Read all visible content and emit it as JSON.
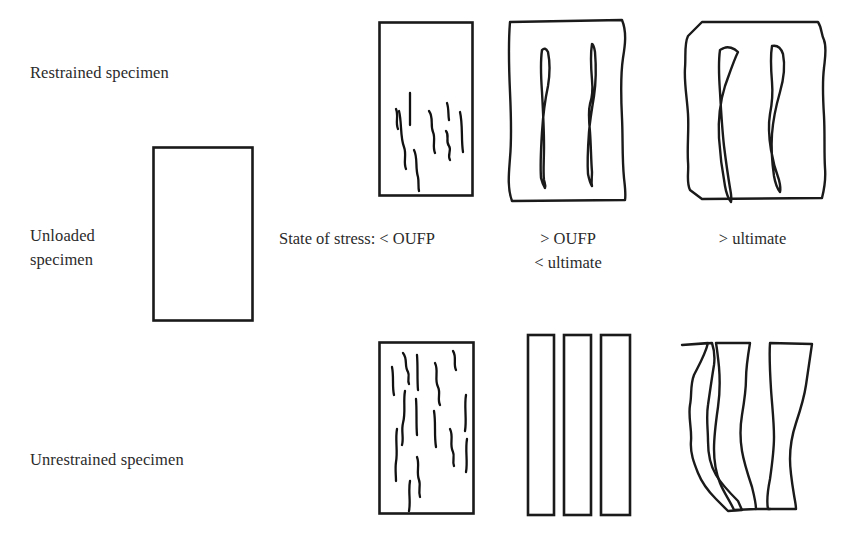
{
  "figure": {
    "background_color": "#ffffff",
    "ink_color": "#1a1a1a",
    "text_color": "#2b2b2b"
  },
  "row_labels": {
    "restrained": "Restrained specimen",
    "unloaded": "Unloaded\nspecimen",
    "unrestrained": "Unrestrained specimen"
  },
  "captions": {
    "prefix": "State of stress:",
    "column1": "State of stress: < OUFP",
    "column2": "> OUFP\n< ultimate",
    "column3": "> ultimate"
  },
  "panels": {
    "unloaded_specimen": {
      "name": "unloaded-specimen",
      "description": "Plain undamaged rectangular prism"
    },
    "restrained_low": {
      "name": "restrained-below-oufp",
      "description": "Rectangular specimen with short scattered microcracks in the central region"
    },
    "restrained_mid": {
      "name": "restrained-above-oufp",
      "description": "Bulged specimen with two elongated lens shaped vertical cracks"
    },
    "restrained_ultimate": {
      "name": "restrained-above-ultimate",
      "description": "Heavily bulged specimen with two wide open vertical cracks"
    },
    "unrestrained_low": {
      "name": "unrestrained-below-oufp",
      "description": "Rectangular specimen with many distributed vertical microcracks"
    },
    "unrestrained_mid": {
      "name": "unrestrained-above-oufp",
      "description": "Specimen split into three separate vertical slabs"
    },
    "unrestrained_ultimate": {
      "name": "unrestrained-above-ultimate",
      "description": "Specimen disintegrated into irregular wavy fragments"
    }
  }
}
